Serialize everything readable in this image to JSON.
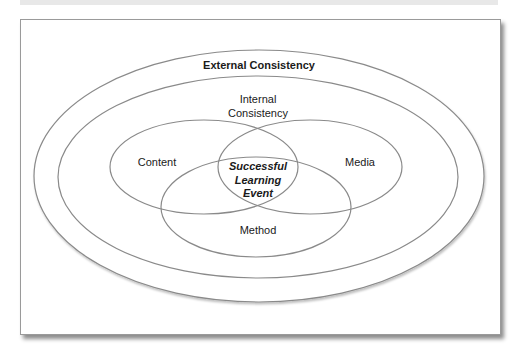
{
  "diagram": {
    "title": "External Consistency",
    "internal_label_line1": "Internal",
    "internal_label_line2": "Consistency",
    "circles": {
      "content": "Content",
      "media": "Media",
      "method": "Method"
    },
    "center_line1": "Successful",
    "center_line2": "Learning",
    "center_line3": "Event",
    "colors": {
      "stroke": "#8a8a8a",
      "text": "#1a1a1a",
      "frame_border": "#9a9a9a"
    }
  }
}
